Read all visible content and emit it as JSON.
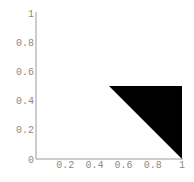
{
  "chart_data": {
    "type": "area",
    "title": "",
    "xlabel": "",
    "ylabel": "",
    "xlim": [
      0,
      1
    ],
    "ylim": [
      0,
      1
    ],
    "grid": false,
    "legend": null,
    "x_ticks": [
      "0.2",
      "0.4",
      "0.6",
      "0.8",
      "1"
    ],
    "y_ticks": [
      "0",
      "0.2",
      "0.4",
      "0.6",
      "0.8",
      "1"
    ],
    "series": [
      {
        "name": "filled-triangle",
        "shape": "polygon",
        "fill": "#000000",
        "points": [
          [
            0.5,
            0.5
          ],
          [
            1.0,
            0.5
          ],
          [
            1.0,
            0.0
          ]
        ]
      }
    ]
  },
  "colors": {
    "axis": "#9a9a9a",
    "label": "#8a8a8a",
    "fill": "#000000",
    "background": "#ffffff"
  }
}
